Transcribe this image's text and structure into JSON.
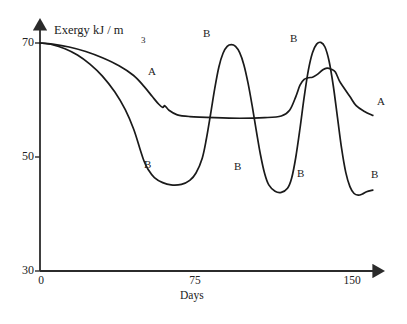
{
  "chart_data": {
    "type": "line",
    "title": "",
    "ylabel": "Exergy kJ / m",
    "ylabel_superscript": "3",
    "xlabel": "Days",
    "xlim": [
      0,
      160
    ],
    "ylim": [
      30,
      72
    ],
    "yticks": [
      30,
      50,
      70
    ],
    "xticks": [
      0,
      75,
      150
    ],
    "grid": false,
    "legend": "inline-curve-labels",
    "series": [
      {
        "name": "A",
        "points": [
          [
            0,
            70.0
          ],
          [
            6,
            69.8
          ],
          [
            14,
            69.3
          ],
          [
            22,
            68.5
          ],
          [
            30,
            67.4
          ],
          [
            38,
            66.0
          ],
          [
            45,
            64.3
          ],
          [
            50,
            62.4
          ],
          [
            54,
            60.6
          ],
          [
            57,
            59.3
          ],
          [
            59,
            58.7
          ],
          [
            60,
            59.0
          ],
          [
            62,
            58.2
          ],
          [
            66,
            57.4
          ],
          [
            72,
            57.1
          ],
          [
            84,
            56.9
          ],
          [
            96,
            56.8
          ],
          [
            108,
            56.9
          ],
          [
            116,
            57.2
          ],
          [
            120,
            58.2
          ],
          [
            123,
            60.6
          ],
          [
            125,
            62.6
          ],
          [
            127,
            63.6
          ],
          [
            129,
            63.9
          ],
          [
            131,
            64.0
          ],
          [
            133,
            64.4
          ],
          [
            136,
            65.3
          ],
          [
            138,
            65.6
          ],
          [
            140,
            65.4
          ],
          [
            142,
            64.9
          ],
          [
            144,
            63.3
          ],
          [
            146,
            62.2
          ],
          [
            149,
            60.6
          ],
          [
            152,
            59.0
          ],
          [
            156,
            58.0
          ],
          [
            160,
            57.3
          ]
        ]
      },
      {
        "name": "B",
        "points": [
          [
            0,
            70.0
          ],
          [
            6,
            69.7
          ],
          [
            12,
            69.0
          ],
          [
            18,
            67.9
          ],
          [
            24,
            66.3
          ],
          [
            30,
            64.2
          ],
          [
            36,
            61.4
          ],
          [
            41,
            58.3
          ],
          [
            45,
            54.9
          ],
          [
            48,
            51.5
          ],
          [
            50,
            49.3
          ],
          [
            52,
            47.8
          ],
          [
            55,
            46.4
          ],
          [
            59,
            45.5
          ],
          [
            63,
            45.1
          ],
          [
            68,
            45.2
          ],
          [
            72,
            45.9
          ],
          [
            75,
            47.2
          ],
          [
            78,
            49.8
          ],
          [
            80,
            53.2
          ],
          [
            82,
            57.5
          ],
          [
            84,
            62.0
          ],
          [
            86,
            65.8
          ],
          [
            88,
            68.2
          ],
          [
            90,
            69.4
          ],
          [
            92,
            69.7
          ],
          [
            94,
            69.4
          ],
          [
            96,
            68.3
          ],
          [
            98,
            66.2
          ],
          [
            100,
            63.0
          ],
          [
            102,
            59.0
          ],
          [
            104,
            54.6
          ],
          [
            106,
            50.4
          ],
          [
            108,
            47.1
          ],
          [
            110,
            45.1
          ],
          [
            113,
            44.0
          ],
          [
            116,
            43.8
          ],
          [
            119,
            44.5
          ],
          [
            121,
            46.3
          ],
          [
            123,
            50.0
          ],
          [
            125,
            55.0
          ],
          [
            127,
            60.5
          ],
          [
            129,
            65.2
          ],
          [
            131,
            68.3
          ],
          [
            133,
            69.8
          ],
          [
            135,
            70.1
          ],
          [
            137,
            69.3
          ],
          [
            139,
            66.8
          ],
          [
            141,
            62.5
          ],
          [
            143,
            57.0
          ],
          [
            145,
            51.5
          ],
          [
            147,
            47.3
          ],
          [
            149,
            44.8
          ],
          [
            151,
            43.6
          ],
          [
            153,
            43.3
          ],
          [
            155,
            43.5
          ],
          [
            157,
            43.9
          ],
          [
            160,
            44.2
          ]
        ]
      }
    ],
    "annotations": [
      {
        "text": "A",
        "x_px": 148,
        "y_px": 66,
        "series": "A"
      },
      {
        "text": "A",
        "x_px": 377,
        "y_px": 96,
        "series": "A"
      },
      {
        "text": "B",
        "x_px": 144,
        "y_px": 159,
        "series": "B"
      },
      {
        "text": "B",
        "x_px": 203,
        "y_px": 28,
        "series": "B"
      },
      {
        "text": "B",
        "x_px": 234,
        "y_px": 161,
        "series": "B"
      },
      {
        "text": "B",
        "x_px": 290,
        "y_px": 33,
        "series": "B"
      },
      {
        "text": "B",
        "x_px": 297,
        "y_px": 168,
        "series": "B"
      },
      {
        "text": "B",
        "x_px": 371,
        "y_px": 169,
        "series": "B"
      }
    ]
  },
  "axis": {
    "ylabel_text": "Exergy kJ / m",
    "ylabel_sup": "3",
    "xlabel_text": "Days",
    "ytick_labels": [
      "70",
      "50",
      "30"
    ],
    "xtick_labels": [
      "0",
      "75",
      "150"
    ]
  },
  "colors": {
    "line": "#1a1a1a",
    "axis": "#2b2b2b",
    "background": "#ffffff",
    "text": "#222222"
  }
}
